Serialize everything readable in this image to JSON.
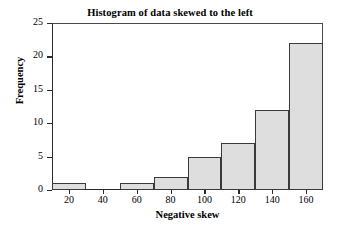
{
  "chart_data": {
    "type": "bar",
    "title": "Histogram of data skewed to the left",
    "xlabel": "Negative skew",
    "ylabel": "Frequency",
    "xlim": [
      10,
      170
    ],
    "ylim": [
      0,
      25
    ],
    "grid": false,
    "legend": null,
    "bin_width": 20,
    "bin_edges": [
      10,
      30,
      50,
      70,
      90,
      110,
      130,
      150,
      170
    ],
    "categories": [
      "10-30",
      "30-50",
      "50-70",
      "70-90",
      "90-110",
      "110-130",
      "130-150",
      "150-170"
    ],
    "bin_centers": [
      20,
      40,
      60,
      80,
      100,
      120,
      140,
      160
    ],
    "values": [
      1,
      0,
      1,
      2,
      5,
      7,
      12,
      22
    ],
    "xticks": [
      20,
      40,
      60,
      80,
      100,
      120,
      140,
      160
    ],
    "xtick_labels": [
      "20",
      "40",
      "60",
      "80",
      "100",
      "120",
      "140",
      "160"
    ],
    "yticks": [
      0,
      5,
      10,
      15,
      20,
      25
    ],
    "ytick_labels": [
      "0",
      "5",
      "10",
      "15",
      "20",
      "25"
    ],
    "bar_fill_color": "#dedede",
    "bar_edge_color": "#3a3a3a",
    "axis_color": "#2b2b2b",
    "background_color": "#ffffff"
  }
}
